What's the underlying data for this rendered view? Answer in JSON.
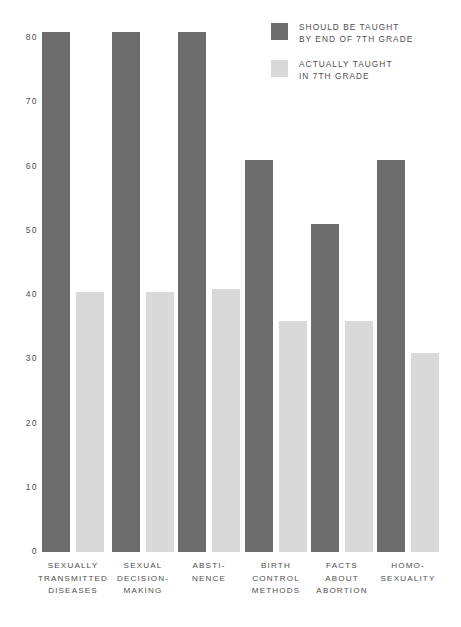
{
  "chart_data": {
    "type": "bar",
    "title": "",
    "xlabel": "",
    "ylabel": "",
    "ylim": [
      0,
      80
    ],
    "yticks": [
      "80",
      "70",
      "60",
      "50",
      "40",
      "30",
      "20",
      "10",
      "0"
    ],
    "ytick_values": [
      80,
      70,
      60,
      50,
      40,
      30,
      20,
      10,
      0
    ],
    "grid": false,
    "legend_position": "top-right",
    "categories": [
      "SEXUALLY\nTRANSMITTED\nDISEASES",
      "SEXUAL\nDECISION-\nMAKING",
      "ABSTI-\nNENCE",
      "BIRTH\nCONTROL\nMETHODS",
      "FACTS\nABOUT\nABORTION",
      "HOMO-\nSEXUALITY"
    ],
    "series": [
      {
        "name": "SHOULD BE TAUGHT\nBY END OF 7TH GRADE",
        "color": "#6d6d6d",
        "values": [
          81,
          81,
          81,
          61,
          51,
          61
        ]
      },
      {
        "name": "ACTUALLY TAUGHT\nIN 7TH GRADE",
        "color": "#d9d9d9",
        "values": [
          40.5,
          40.5,
          41,
          36,
          36,
          31
        ]
      }
    ]
  },
  "legend": {
    "items": [
      {
        "label": "SHOULD BE TAUGHT\nBY END OF 7TH GRADE",
        "color": "#6d6d6d"
      },
      {
        "label": "ACTUALLY TAUGHT\nIN 7TH GRADE",
        "color": "#d9d9d9"
      }
    ]
  }
}
